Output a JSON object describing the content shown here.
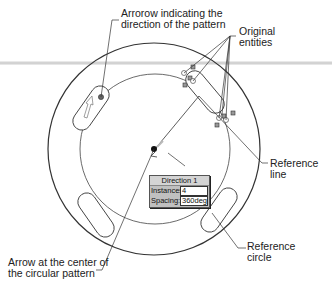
{
  "annotations": {
    "direction_arrow": [
      "Arrorow indicating the",
      "direction of the pattern"
    ],
    "original_entities": [
      "Original",
      "entities"
    ],
    "reference_line": [
      "Reference",
      "line"
    ],
    "reference_circle": [
      "Reference",
      "circle"
    ],
    "center_arrow": [
      "Arrow at the center of",
      "the circular pattern"
    ]
  },
  "dialog": {
    "title": "Direction 1",
    "instances_label": "Instances:",
    "instances_value": "4",
    "spacing_label": "Spacing:",
    "spacing_value": "360deg"
  },
  "colors": {
    "line": "#333333",
    "dialog_bg": "#c0c0c0",
    "preview_arrow": "#bbbbbb"
  }
}
